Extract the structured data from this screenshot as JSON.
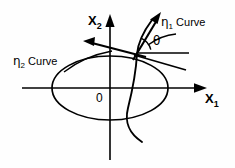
{
  "figure": {
    "background_color": "#fefefe",
    "line_color": "#000000",
    "axes": {
      "x_axis": {
        "label_text": "X",
        "label_sub": "1",
        "name": "x1-axis",
        "start": [
          22,
          88
        ],
        "end": [
          203,
          88
        ],
        "arrow": "right"
      },
      "y_axis": {
        "label_text": "X",
        "label_sub": "2",
        "name": "x2-axis",
        "start": [
          110,
          160
        ],
        "end": [
          110,
          16
        ],
        "arrow": "up"
      }
    },
    "origin": {
      "label": "0",
      "position": [
        110,
        88
      ]
    },
    "labels": {
      "eta1_curve": {
        "symbol": "η",
        "subscript": "1",
        "text": " Curve"
      },
      "eta2_curve": {
        "symbol": "η",
        "subscript": "2",
        "text": " Curve"
      },
      "theta": "θ"
    },
    "curves": {
      "eta2_ellipse": {
        "name": "eta2-curve-ellipse",
        "center": [
          110,
          88
        ],
        "rx": 58,
        "ry": 32
      },
      "eta1_curve": {
        "name": "eta1-curve",
        "description": "steep curve crossing the ellipse near the upper right"
      }
    },
    "vectors": {
      "eta1_tangent": {
        "name": "eta1-tangent-vector",
        "from": [
          137,
          53
        ],
        "to": [
          160,
          14
        ],
        "arrow": "tip"
      },
      "eta2_tangent": {
        "name": "eta2-tangent-vector",
        "from": [
          137,
          53
        ],
        "to": [
          86,
          41
        ],
        "arrow": "tip"
      }
    },
    "angle_arc": {
      "name": "theta-angle-arc",
      "vertex": [
        137,
        53
      ],
      "between": [
        "eta1-tangent-vector",
        "tangent-line-right"
      ]
    }
  }
}
